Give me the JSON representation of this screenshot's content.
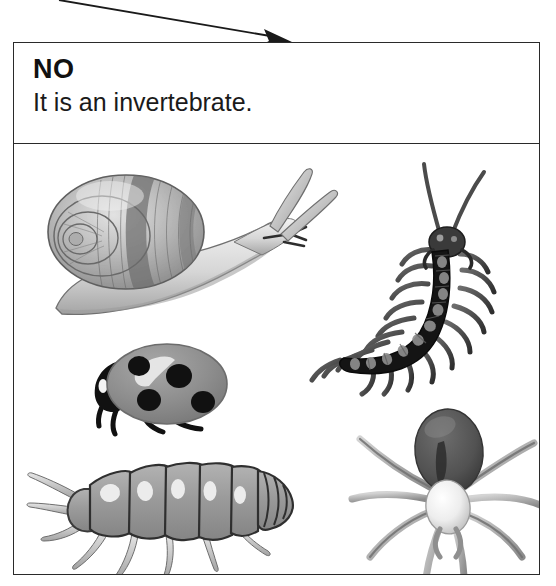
{
  "card": {
    "verdict": "NO",
    "statement": "It is an invertebrate."
  },
  "arrow": {
    "name": "incoming-flow-arrow",
    "color": "#1a1a1a",
    "start": [
      59,
      0
    ],
    "end": [
      291,
      41
    ]
  },
  "colors": {
    "border": "#2a2a2a",
    "background": "#ffffff",
    "ink": "#111111",
    "mid_gray": "#8d8d8d",
    "light_gray": "#c9c9c9",
    "dark_gray": "#4a4a4a",
    "near_black": "#111111",
    "shell_gray": "#b4b4b4",
    "highlight": "#f2f2f2"
  },
  "illustration": {
    "caption_absent": true,
    "specimens": [
      {
        "id": "snail",
        "label": "snail",
        "group": "mollusc",
        "position": [
          24,
          18
        ],
        "size": [
          300,
          170
        ],
        "features": [
          "spiral shell",
          "soft foot",
          "two pairs of tentacles"
        ]
      },
      {
        "id": "centipede",
        "label": "centipede",
        "group": "myriapod",
        "position": [
          288,
          6
        ],
        "size": [
          235,
          270
        ],
        "features": [
          "many segments",
          "many legs",
          "two long antennae"
        ]
      },
      {
        "id": "ladybug",
        "label": "ladybird beetle",
        "group": "insect",
        "position": [
          55,
          190
        ],
        "size": [
          175,
          115
        ],
        "features": [
          "domed elytra",
          "four spots",
          "black head",
          "legs"
        ]
      },
      {
        "id": "woodlouse",
        "label": "woodlouse",
        "group": "crustacean",
        "position": [
          12,
          305
        ],
        "size": [
          285,
          135
        ],
        "features": [
          "segmented armour plates",
          "antennae",
          "seven leg pairs"
        ]
      },
      {
        "id": "spider",
        "label": "spider",
        "group": "arachnid",
        "position": [
          330,
          255
        ],
        "size": [
          205,
          185
        ],
        "features": [
          "dark abdomen",
          "pale cephalothorax",
          "eight legs"
        ]
      }
    ]
  }
}
